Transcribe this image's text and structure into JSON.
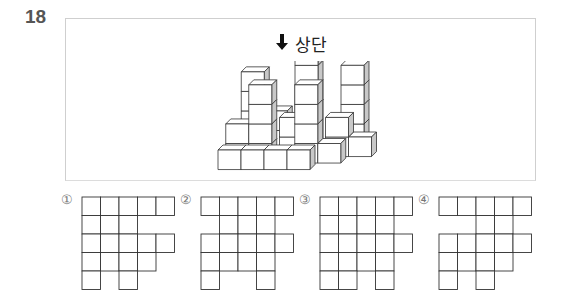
{
  "question": {
    "number": "18",
    "direction_label": "상단",
    "direction_icon": "arrow-down-icon"
  },
  "figure": {
    "face_colors": {
      "top": "#ffffff",
      "front": "#ffffff",
      "side": "#c8c8c8",
      "stroke": "#333333"
    }
  },
  "options": [
    {
      "mark": "①",
      "grid": [
        [
          1,
          1,
          1,
          1,
          1
        ],
        [
          1,
          1,
          1,
          0,
          0
        ],
        [
          1,
          1,
          1,
          1,
          1
        ],
        [
          1,
          1,
          1,
          1,
          0
        ],
        [
          1,
          0,
          1,
          0,
          0
        ]
      ]
    },
    {
      "mark": "②",
      "grid": [
        [
          1,
          1,
          1,
          1,
          1
        ],
        [
          0,
          1,
          1,
          1,
          0
        ],
        [
          1,
          1,
          1,
          1,
          1
        ],
        [
          1,
          1,
          1,
          1,
          0
        ],
        [
          1,
          0,
          0,
          1,
          0
        ]
      ]
    },
    {
      "mark": "③",
      "grid": [
        [
          1,
          1,
          1,
          1,
          1
        ],
        [
          1,
          1,
          1,
          1,
          0
        ],
        [
          1,
          1,
          1,
          1,
          1
        ],
        [
          1,
          1,
          1,
          1,
          0
        ],
        [
          1,
          1,
          0,
          1,
          0
        ]
      ]
    },
    {
      "mark": "④",
      "grid": [
        [
          1,
          1,
          1,
          1,
          1
        ],
        [
          0,
          0,
          1,
          1,
          0
        ],
        [
          1,
          1,
          1,
          1,
          1
        ],
        [
          1,
          1,
          1,
          1,
          0
        ],
        [
          1,
          0,
          1,
          0,
          0
        ]
      ]
    }
  ]
}
